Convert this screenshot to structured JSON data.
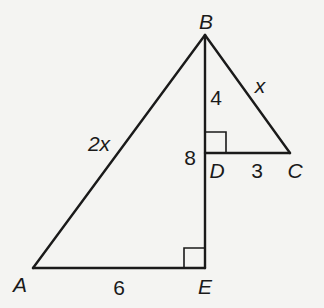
{
  "diagram": {
    "type": "geometry-figure",
    "stroke_color": "#1a1a1a",
    "background_color": "#f4f4f2",
    "points": {
      "A": {
        "label": "A",
        "x": 33,
        "y": 268
      },
      "B": {
        "label": "B",
        "x": 205,
        "y": 35
      },
      "C": {
        "label": "C",
        "x": 290,
        "y": 153
      },
      "D": {
        "label": "D",
        "x": 205,
        "y": 153
      },
      "E": {
        "label": "E",
        "x": 205,
        "y": 268
      }
    },
    "segments": [
      {
        "from": "A",
        "to": "B",
        "label": "2x"
      },
      {
        "from": "B",
        "to": "E",
        "label": "8"
      },
      {
        "from": "A",
        "to": "E",
        "label": "6"
      },
      {
        "from": "B",
        "to": "C",
        "label": "x"
      },
      {
        "from": "B",
        "to": "D",
        "label": "4"
      },
      {
        "from": "D",
        "to": "C",
        "label": "3"
      }
    ],
    "right_angles": [
      "D",
      "E"
    ],
    "labels": {
      "vertex_A": "A",
      "vertex_B": "B",
      "vertex_C": "C",
      "vertex_D": "D",
      "vertex_E": "E",
      "side_AB": "2x",
      "side_BC": "x",
      "side_BD": "4",
      "side_BE": "8",
      "side_DC": "3",
      "side_AE": "6"
    }
  }
}
